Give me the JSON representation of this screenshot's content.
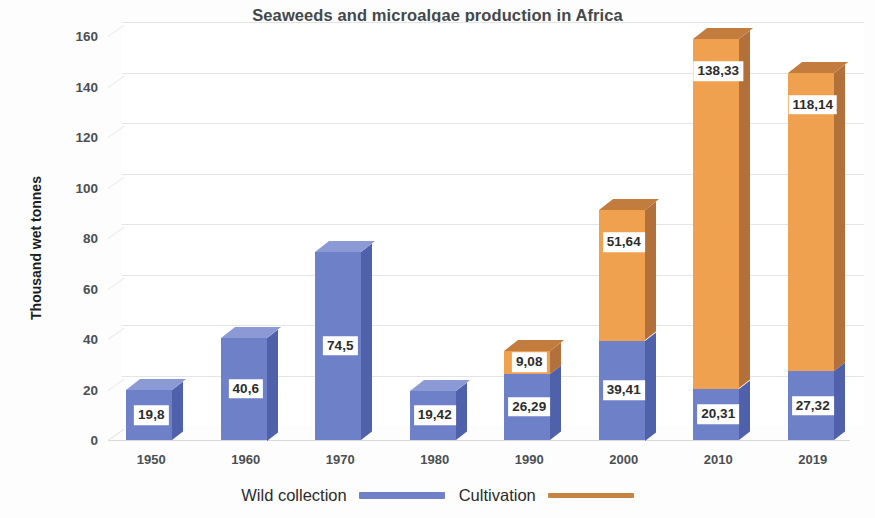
{
  "chart_data": {
    "type": "bar",
    "subtype": "stacked-column-3d",
    "title": "Seaweeds and microalgae production in Africa",
    "xlabel": "",
    "ylabel": "Thousand wet tonnes",
    "categories": [
      "1950",
      "1960",
      "1970",
      "1980",
      "1990",
      "2000",
      "2010",
      "2019"
    ],
    "series": [
      {
        "name": "Wild collection",
        "color": "#6e81c8",
        "values": [
          19.8,
          40.6,
          74.5,
          19.42,
          26.29,
          39.41,
          20.31,
          27.32
        ],
        "labels": [
          "19,8",
          "40,6",
          "74,5",
          "19,42",
          "26,29",
          "39,41",
          "20,31",
          "27,32"
        ]
      },
      {
        "name": "Cultivation",
        "color": "#f0a14f",
        "values": [
          0,
          0,
          0,
          0,
          9.08,
          51.64,
          138.33,
          118.14
        ],
        "labels": [
          "",
          "",
          "",
          "",
          "9,08",
          "51,64",
          "138,33",
          "118,14"
        ]
      }
    ],
    "ylim": [
      0,
      160
    ],
    "yticks": [
      "0",
      "20",
      "40",
      "60",
      "80",
      "100",
      "120",
      "140",
      "160"
    ],
    "grid": true,
    "legend_position": "bottom"
  },
  "legend": {
    "items": [
      {
        "label": "Wild collection",
        "marker": "blue-line"
      },
      {
        "label": "Cultivation",
        "marker": "orange-line"
      }
    ]
  }
}
